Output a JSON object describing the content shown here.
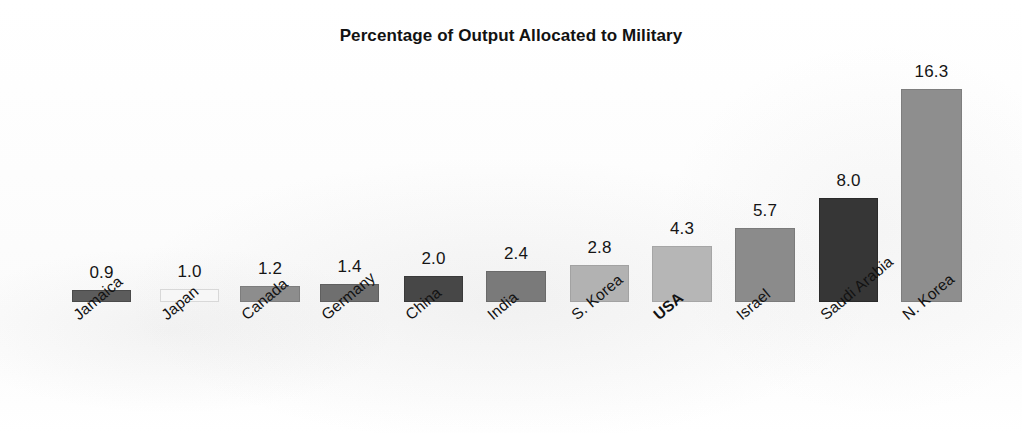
{
  "chart_data": {
    "type": "bar",
    "title": "Percentage of Output Allocated to Military",
    "xlabel": "",
    "ylabel": "",
    "ylim": [
      0,
      16.3
    ],
    "grid": false,
    "legend": false,
    "axis_visible": false,
    "value_labels_shown": true,
    "label_rotation_deg": -40,
    "categories": [
      "Jamaica",
      "Japan",
      "Canada",
      "Germany",
      "China",
      "India",
      "S. Korea",
      "USA",
      "Israel",
      "Saudi Arabia",
      "N. Korea"
    ],
    "values": [
      0.9,
      1.0,
      1.2,
      1.4,
      2.0,
      2.4,
      2.8,
      4.3,
      5.7,
      8.0,
      16.3
    ],
    "value_label_text": [
      "0.9",
      "1.0",
      "1.2",
      "1.4",
      "2.0",
      "2.4",
      "2.8",
      "4.3",
      "5.7",
      "8.0",
      "16.3"
    ],
    "bar_colors": [
      "#5c5c5c",
      "#f7f7f7",
      "#8d8d8d",
      "#6f6f6f",
      "#474747",
      "#7a7a7a",
      "#b2b2b2",
      "#b6b6b6",
      "#8b8b8b",
      "#363636",
      "#8e8e8e"
    ],
    "emphasized_category": "USA"
  },
  "bars": [
    {
      "name": "Jamaica",
      "value": 0.9,
      "value_text": "0.9",
      "color": "#5c5c5c",
      "border": "#4a4a4a",
      "x": 72,
      "width": 59,
      "bold": false
    },
    {
      "name": "Japan",
      "value": 1.0,
      "value_text": "1.0",
      "color": "#f7f7f7",
      "border": "#d8d8d8",
      "x": 160,
      "width": 59,
      "bold": false
    },
    {
      "name": "Canada",
      "value": 1.2,
      "value_text": "1.2",
      "color": "#8d8d8d",
      "border": "#7d7d7d",
      "x": 240,
      "width": 60,
      "bold": false
    },
    {
      "name": "Germany",
      "value": 1.4,
      "value_text": "1.4",
      "color": "#6f6f6f",
      "border": "#5f5f5f",
      "x": 320,
      "width": 59,
      "bold": false
    },
    {
      "name": "China",
      "value": 2.0,
      "value_text": "2.0",
      "color": "#474747",
      "border": "#3a3a3a",
      "x": 404,
      "width": 59,
      "bold": false
    },
    {
      "name": "India",
      "value": 2.4,
      "value_text": "2.4",
      "color": "#7a7a7a",
      "border": "#6a6a6a",
      "x": 486,
      "width": 60,
      "bold": false
    },
    {
      "name": "S. Korea",
      "value": 2.8,
      "value_text": "2.8",
      "color": "#b2b2b2",
      "border": "#a2a2a2",
      "x": 570,
      "width": 59,
      "bold": false
    },
    {
      "name": "USA",
      "value": 4.3,
      "value_text": "4.3",
      "color": "#b6b6b6",
      "border": "#a6a6a6",
      "x": 652,
      "width": 60,
      "bold": true
    },
    {
      "name": "Israel",
      "value": 5.7,
      "value_text": "5.7",
      "color": "#8b8b8b",
      "border": "#7b7b7b",
      "x": 735,
      "width": 60,
      "bold": false
    },
    {
      "name": "Saudi Arabia",
      "value": 8.0,
      "value_text": "8.0",
      "color": "#363636",
      "border": "#2a2a2a",
      "x": 819,
      "width": 59,
      "bold": false
    },
    {
      "name": "N. Korea",
      "value": 16.3,
      "value_text": "16.3",
      "color": "#8e8e8e",
      "border": "#7e7e7e",
      "x": 901,
      "width": 61,
      "bold": false
    }
  ],
  "geometry": {
    "baseline_y": 302,
    "px_per_unit": 13.05,
    "value_label_offset": 7,
    "label_offset_y": 8,
    "label_offset_x": -2
  }
}
